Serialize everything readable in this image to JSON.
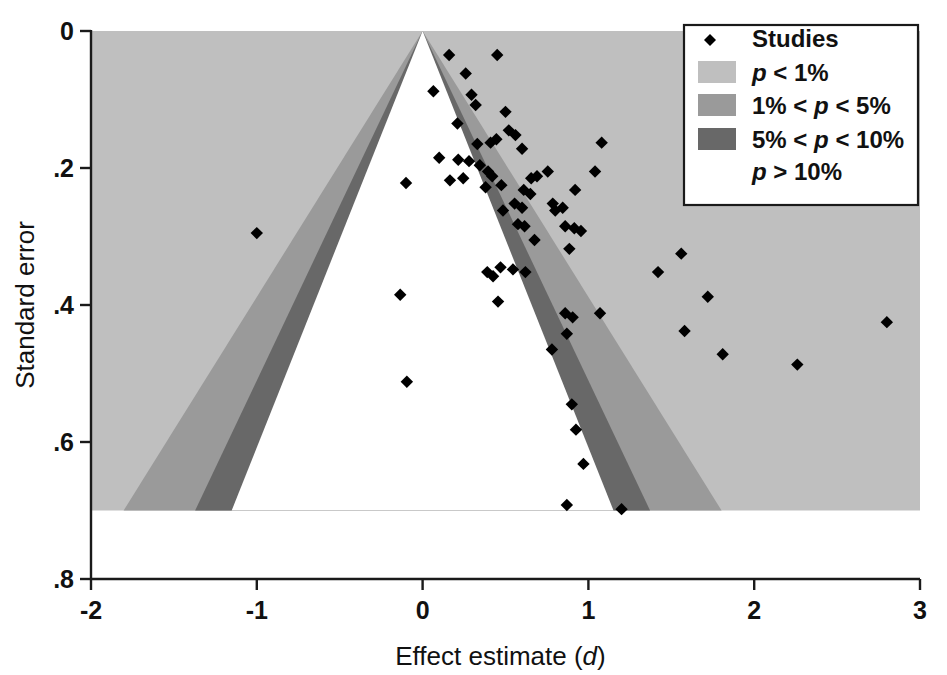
{
  "chart_data": {
    "type": "scatter",
    "title": "",
    "xlabel": "Effect estimate (d)",
    "ylabel": "Standard error",
    "xlim": [
      -2,
      3
    ],
    "ylim": [
      0,
      0.8
    ],
    "y_inverted": true,
    "grid": false,
    "xticks": [
      "-2",
      "-1",
      "0",
      "1",
      "2",
      "3"
    ],
    "xtick_values": [
      -2,
      -1,
      0,
      1,
      2,
      3
    ],
    "yticks": [
      "0",
      ".2",
      ".4",
      ".6",
      ".8"
    ],
    "ytick_values": [
      0,
      0.2,
      0.4,
      0.6,
      0.8
    ],
    "legend_position": "top-right",
    "series": [
      {
        "name": "Studies",
        "marker": "diamond",
        "color": "#000000",
        "points": [
          [
            0.16,
            0.035
          ],
          [
            0.26,
            0.062
          ],
          [
            0.45,
            0.035
          ],
          [
            0.065,
            0.088
          ],
          [
            0.295,
            0.093
          ],
          [
            0.32,
            0.108
          ],
          [
            0.21,
            0.135
          ],
          [
            0.5,
            0.118
          ],
          [
            0.52,
            0.145
          ],
          [
            0.33,
            0.165
          ],
          [
            0.41,
            0.163
          ],
          [
            0.445,
            0.158
          ],
          [
            0.56,
            0.152
          ],
          [
            0.6,
            0.172
          ],
          [
            1.08,
            0.163
          ],
          [
            0.1,
            0.185
          ],
          [
            0.215,
            0.188
          ],
          [
            0.28,
            0.19
          ],
          [
            0.345,
            0.196
          ],
          [
            0.395,
            0.205
          ],
          [
            0.42,
            0.212
          ],
          [
            0.245,
            0.215
          ],
          [
            0.165,
            0.218
          ],
          [
            -0.1,
            0.222
          ],
          [
            0.38,
            0.228
          ],
          [
            0.475,
            0.225
          ],
          [
            0.655,
            0.215
          ],
          [
            0.69,
            0.212
          ],
          [
            0.755,
            0.205
          ],
          [
            1.04,
            0.205
          ],
          [
            0.61,
            0.232
          ],
          [
            0.65,
            0.238
          ],
          [
            0.92,
            0.232
          ],
          [
            0.555,
            0.252
          ],
          [
            0.6,
            0.258
          ],
          [
            0.485,
            0.262
          ],
          [
            0.785,
            0.252
          ],
          [
            0.8,
            0.262
          ],
          [
            0.845,
            0.258
          ],
          [
            0.575,
            0.282
          ],
          [
            0.615,
            0.285
          ],
          [
            0.86,
            0.285
          ],
          [
            0.915,
            0.288
          ],
          [
            0.955,
            0.292
          ],
          [
            -1.0,
            0.295
          ],
          [
            0.675,
            0.305
          ],
          [
            0.885,
            0.318
          ],
          [
            1.56,
            0.325
          ],
          [
            0.47,
            0.345
          ],
          [
            0.545,
            0.348
          ],
          [
            0.62,
            0.352
          ],
          [
            1.42,
            0.352
          ],
          [
            0.425,
            0.358
          ],
          [
            0.39,
            0.352
          ],
          [
            -0.135,
            0.385
          ],
          [
            1.72,
            0.388
          ],
          [
            0.455,
            0.395
          ],
          [
            0.86,
            0.412
          ],
          [
            0.905,
            0.418
          ],
          [
            1.07,
            0.412
          ],
          [
            2.8,
            0.425
          ],
          [
            1.58,
            0.438
          ],
          [
            0.87,
            0.442
          ],
          [
            0.78,
            0.465
          ],
          [
            1.81,
            0.472
          ],
          [
            2.26,
            0.487
          ],
          [
            -0.095,
            0.512
          ],
          [
            0.9,
            0.545
          ],
          [
            0.925,
            0.582
          ],
          [
            0.97,
            0.632
          ],
          [
            0.87,
            0.692
          ],
          [
            1.2,
            0.698
          ]
        ]
      }
    ],
    "significance_contours": {
      "description": "Contour-enhanced funnel plot shaded by p-value regions around effect = 0",
      "center": 0,
      "regions": [
        {
          "label": "p < 1%",
          "z_min": 2.576,
          "z_max": null,
          "color": "#bfbfbf"
        },
        {
          "label": "1% < p < 5%",
          "z_min": 1.96,
          "z_max": 2.576,
          "color": "#9a9a9a"
        },
        {
          "label": "5% < p < 10%",
          "z_min": 1.645,
          "z_max": 1.96,
          "color": "#686868"
        },
        {
          "label": "p > 10%",
          "z_min": 0,
          "z_max": 1.645,
          "color": "#ffffff"
        }
      ]
    },
    "legend": {
      "entries": [
        {
          "label": "Studies",
          "swatch": "marker",
          "color": "#000000"
        },
        {
          "label": "p < 1%",
          "swatch": "box",
          "color": "#bfbfbf"
        },
        {
          "label": "1% < p < 5%",
          "swatch": "box",
          "color": "#9a9a9a"
        },
        {
          "label": "5% < p < 10%",
          "swatch": "box",
          "color": "#686868"
        },
        {
          "label": "p > 10%",
          "swatch": "none",
          "color": "#ffffff"
        }
      ]
    }
  },
  "axes": {
    "x_title_main": "Effect estimate (",
    "x_title_italic": "d",
    "x_title_end": ")",
    "y_title": "Standard error"
  },
  "legend_labels": {
    "studies": "Studies",
    "p1_pre": "p",
    "p1_post": " < 1%",
    "p5_pre": "1% < ",
    "p5_i": "p",
    "p5_post": " < 5%",
    "p10_pre": "5% < ",
    "p10_i": "p",
    "p10_post": " < 10%",
    "pgt_i": "p",
    "pgt_post": " > 10%"
  },
  "tick_text": {
    "x": [
      "-2",
      "-1",
      "0",
      "1",
      "2",
      "3"
    ],
    "y": [
      "0",
      ".2",
      ".4",
      ".6",
      ".8"
    ]
  }
}
